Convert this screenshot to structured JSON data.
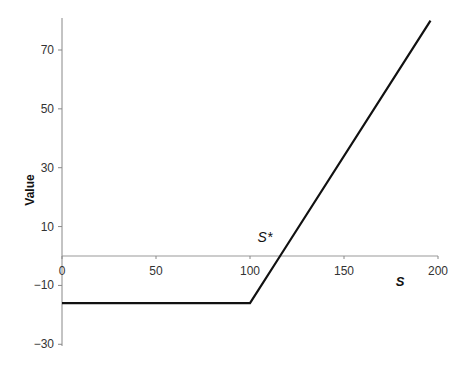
{
  "chart_data": {
    "type": "line",
    "title": "",
    "xlabel": "S",
    "ylabel": "Value",
    "xlim": [
      0,
      200
    ],
    "ylim": [
      -30,
      80
    ],
    "x_ticks": [
      0,
      50,
      100,
      150,
      200
    ],
    "y_ticks": [
      -30,
      -10,
      10,
      30,
      50,
      70
    ],
    "grid": false,
    "legend": null,
    "series": [
      {
        "name": "Payoff",
        "color": "#111111",
        "x": [
          0,
          100,
          116,
          196
        ],
        "y": [
          -16,
          -16,
          0,
          80
        ]
      }
    ],
    "zero_line": {
      "y": 0,
      "color": "#999999"
    },
    "annotations": [
      {
        "text": "S*",
        "x": 110,
        "y": 6
      }
    ]
  },
  "labels": {
    "ylabel": "Value",
    "xlabel": "S",
    "annotation": "S*"
  }
}
